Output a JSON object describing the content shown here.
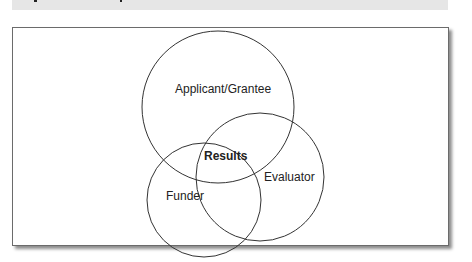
{
  "figure": {
    "caption_bar_color": "#e6e6e6",
    "frame_border_color": "#6b6b6b"
  },
  "diagram": {
    "type": "venn",
    "sets": [
      {
        "label": "Applicant/Grantee",
        "cx": 218,
        "cy": 107,
        "r": 76
      },
      {
        "label": "Funder",
        "cx": 204,
        "cy": 200,
        "r": 57
      },
      {
        "label": "Evaluator",
        "cx": 260,
        "cy": 177,
        "r": 64
      }
    ],
    "intersection_label": "Results",
    "stroke_color": "#333333"
  }
}
